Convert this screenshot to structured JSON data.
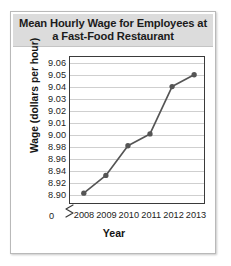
{
  "chart_data": {
    "type": "line",
    "title": "Mean Hourly Wage for Employees at a Fast-Food Restaurant",
    "xlabel": "Year",
    "ylabel": "Wage (dollars per hour)",
    "categories": [
      "2008",
      "2009",
      "2010",
      "2011",
      "2012",
      "2013"
    ],
    "values": [
      8.9,
      8.93,
      8.98,
      9.0,
      9.04,
      9.05
    ],
    "series": [
      {
        "name": "Mean hourly wage",
        "values": [
          8.9,
          8.93,
          8.98,
          9.0,
          9.04,
          9.05
        ]
      }
    ],
    "y_tick_labels": [
      "8.90",
      "8.92",
      "8.94",
      "8.96",
      "8.98",
      "9.00",
      "9.01",
      "9.02",
      "9.03",
      "9.04",
      "9.05",
      "9.06"
    ],
    "y_axis_note": "non-uniform scale: 0.02 steps from 8.90 to 9.00, then 0.01 steps from 9.00 to 9.06",
    "axis_break_label": "0",
    "has_axis_break": true,
    "grid": true,
    "legend": "none",
    "line_color": "#555555",
    "marker_color": "#555555",
    "grid_color": "#cfcfcf",
    "banner_color": "#dcdcdc"
  }
}
